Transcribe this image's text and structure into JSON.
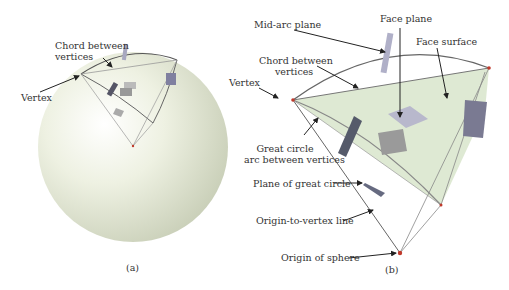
{
  "panel_a": {
    "caption": "(a)",
    "labels": {
      "chord_line1": "Chord between",
      "chord_line2": "vertices",
      "vertex": "Vertex"
    }
  },
  "panel_b": {
    "caption": "(b)",
    "labels": {
      "mid_arc_plane": "Mid-arc plane",
      "face_plane": "Face plane",
      "face_surface": "Face surface",
      "chord_line1": "Chord between",
      "chord_line2": "vertices",
      "vertex": "Vertex",
      "great_circle_line1": "Great circle",
      "great_circle_line2": "arc between vertices",
      "plane_of_great_circle": "Plane of great circle",
      "origin_to_vertex": "Origin-to-vertex line",
      "origin_of_sphere": "Origin of sphere"
    }
  },
  "colors": {
    "sphere": "#e8ecd8",
    "face_fill": "#d6e4c8",
    "edge": "#6a6a6a",
    "plane": "#8a8aa0",
    "vertex_dot": "#c0392b"
  }
}
